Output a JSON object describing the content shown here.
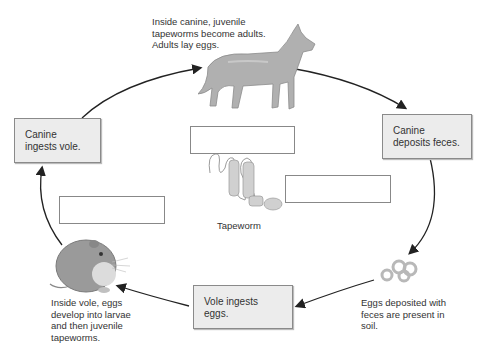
{
  "diagram": {
    "title_cutoff": "",
    "type": "tapeworm life cycle",
    "stages": [
      {
        "id": "canine-ingests",
        "label": "Canine ingests vole."
      },
      {
        "id": "canine-deposits",
        "label": "Canine deposits feces."
      },
      {
        "id": "vole-ingests",
        "label": "Vole ingests eggs."
      }
    ],
    "captions": {
      "canine": "Inside canine, juvenile tapeworms become adults. Adults lay eggs.",
      "eggs": "Eggs deposited with feces are present in soil.",
      "vole": "Inside vole, eggs develop into larvae and then juvenile tapeworms.",
      "tapeworm": "Tapeworm"
    },
    "blank_boxes": [
      {
        "id": "blank-canine",
        "value": ""
      },
      {
        "id": "blank-tapeworm",
        "value": ""
      },
      {
        "id": "blank-vole",
        "value": ""
      }
    ],
    "colors": {
      "stage_fill": "#ececec",
      "stage_border": "#8a8a8a",
      "arrow": "#222222",
      "illustration": "#a8a8a8"
    }
  }
}
